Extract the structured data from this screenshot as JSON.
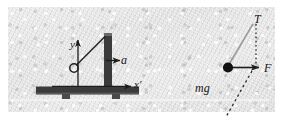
{
  "figure": {
    "background_color": "#e6e6e6",
    "ink_color": "#2b2b2b",
    "panel": {
      "x": 8,
      "y": 7,
      "width": 267,
      "height": 105
    }
  },
  "left_diagram": {
    "name": "accelerating-cart-with-pendulum",
    "labels": {
      "acceleration": "a",
      "x_axis": "x′",
      "y_axis": "y′"
    },
    "cart": {
      "base_color": "#3a3a3a",
      "post_color": "#3a3a3a",
      "wheel_count": 2
    },
    "pendulum": {
      "pivot": {
        "x": 104,
        "y": 36
      },
      "bob": {
        "x": 74,
        "y": 68,
        "radius": 4
      },
      "string_style": "solid"
    },
    "acceleration_arrow": {
      "from_x": 108,
      "to_x": 119,
      "y": 60,
      "direction": "right"
    },
    "axis_arrows": {
      "x_prime": {
        "from_x": 78,
        "to_x": 131,
        "y": 86,
        "direction": "right"
      },
      "y_prime": {
        "x": 78,
        "from_y": 86,
        "to_y": 40,
        "direction": "up"
      }
    }
  },
  "right_diagram": {
    "name": "free-body-diagram",
    "mass_point": {
      "x": 228,
      "y": 68,
      "radius": 5,
      "color": "#111111"
    },
    "forces": [
      {
        "symbol": "T",
        "name": "tension",
        "direction": "up-right",
        "line_style": "solid",
        "label_x": 254,
        "label_y": 13
      },
      {
        "symbol": "F",
        "name": "net-force",
        "direction": "right",
        "line_style": "solid",
        "label_x": 264,
        "label_y": 62
      },
      {
        "symbol": "mg",
        "name": "weight",
        "direction": "down",
        "line_style": "dashed",
        "label_x": 195,
        "label_y": 82
      }
    ],
    "dotted_vertical": {
      "x": 256,
      "from_y": 24,
      "to_y": 66
    },
    "dashed_diagonal": {
      "from_x": 251,
      "from_y": 72,
      "to_x": 226,
      "to_y": 116
    }
  }
}
